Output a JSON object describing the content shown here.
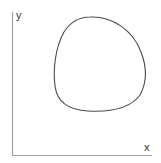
{
  "diagram": {
    "axes": {
      "x_label": "x",
      "y_label": "y",
      "color": "#999999"
    },
    "curve": {
      "description": "closed convex loop",
      "color": "#444444"
    }
  }
}
